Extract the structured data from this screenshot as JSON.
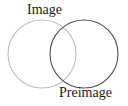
{
  "diagram": {
    "type": "venn",
    "labels": {
      "image": "Image",
      "preimage": "Preimage"
    },
    "circles": [
      {
        "name": "image",
        "cx": 42,
        "cy": 54,
        "r": 34,
        "stroke": "#bdbdbd"
      },
      {
        "name": "preimage",
        "cx": 84,
        "cy": 54,
        "r": 34,
        "stroke": "#4d4d4d"
      }
    ]
  }
}
